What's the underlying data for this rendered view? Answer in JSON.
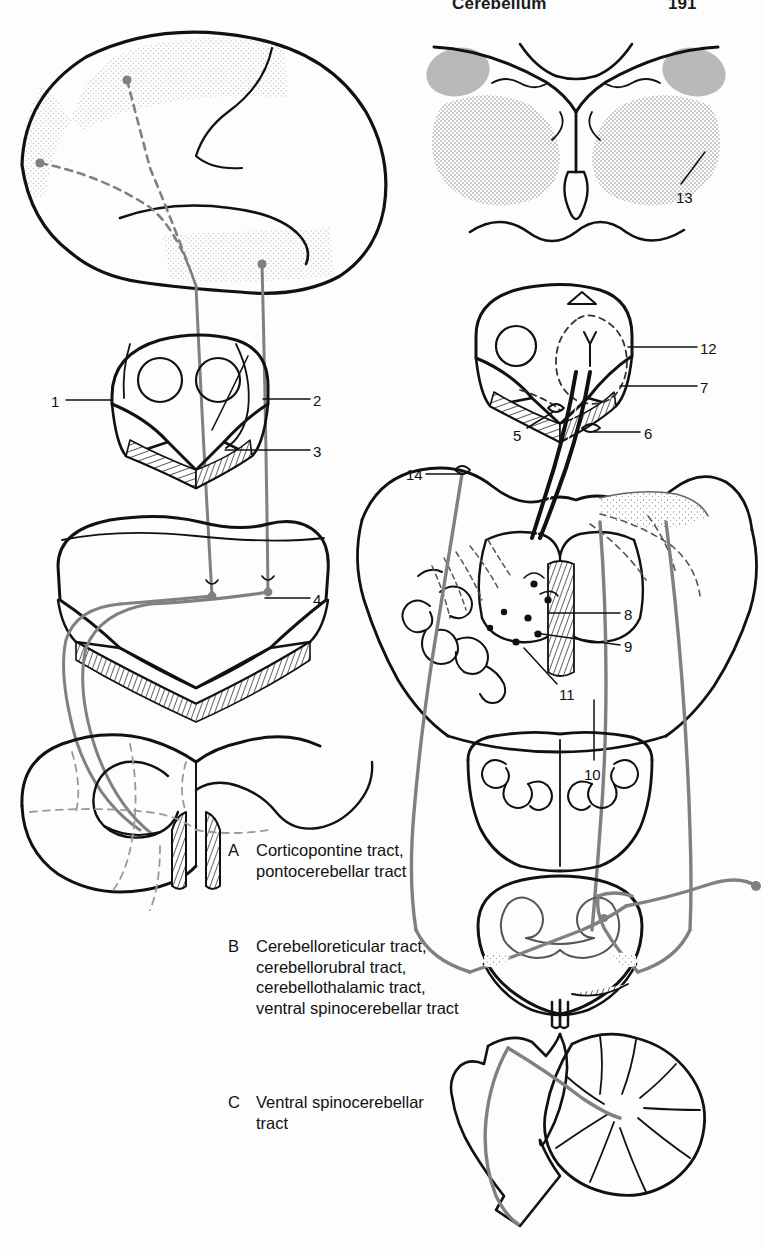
{
  "page": {
    "width": 763,
    "height": 1250,
    "background": "#fdfdfd",
    "running_head": {
      "title": "Cerebellum",
      "page_number": "191"
    }
  },
  "figure": {
    "ink_color": "#111111",
    "tract_color": "#808080",
    "shade_color": "#b8b8b8",
    "light_shade_color": "#dcdcdc",
    "panels": [
      {
        "id": "cerebral-hemisphere",
        "name": "Lateral cerebral hemisphere"
      },
      {
        "id": "diencephalon-section",
        "name": "Thalamus cross-section"
      },
      {
        "id": "midbrain-section-left",
        "name": "Midbrain cross-section"
      },
      {
        "id": "midbrain-section-right",
        "name": "Midbrain cross-section"
      },
      {
        "id": "pons-section-left",
        "name": "Pons cross-section"
      },
      {
        "id": "pons-cerebellum-section",
        "name": "Pons and cerebellum cross-section"
      },
      {
        "id": "medulla-section-left",
        "name": "Medulla oblongata cross-section"
      },
      {
        "id": "medulla-section-right",
        "name": "Medulla oblongata cross-section"
      },
      {
        "id": "spinal-cord-section",
        "name": "Spinal cord cross-section"
      },
      {
        "id": "cerebellum-sagittal",
        "name": "Cerebellum and brainstem sagittal view"
      }
    ]
  },
  "numbered_labels": [
    {
      "id": "1",
      "text": "1",
      "x": 51,
      "y": 394,
      "leader": {
        "x1": 66,
        "y1": 400,
        "x2": 112,
        "y2": 400
      }
    },
    {
      "id": "2",
      "text": "2",
      "x": 313,
      "y": 393,
      "leader": {
        "x1": 310,
        "y1": 399,
        "x2": 263,
        "y2": 399
      }
    },
    {
      "id": "3",
      "text": "3",
      "x": 313,
      "y": 444,
      "leader": {
        "x1": 310,
        "y1": 450,
        "x2": 225,
        "y2": 450
      }
    },
    {
      "id": "4",
      "text": "4",
      "x": 313,
      "y": 592,
      "leader": {
        "x1": 310,
        "y1": 598,
        "x2": 265,
        "y2": 598
      }
    },
    {
      "id": "5",
      "text": "5",
      "x": 513,
      "y": 428,
      "leader": {
        "x1": 527,
        "y1": 428,
        "x2": 553,
        "y2": 412
      }
    },
    {
      "id": "6",
      "text": "6",
      "x": 644,
      "y": 426,
      "leader": {
        "x1": 640,
        "y1": 432,
        "x2": 594,
        "y2": 432
      }
    },
    {
      "id": "7",
      "text": "7",
      "x": 700,
      "y": 380,
      "leader": {
        "x1": 697,
        "y1": 386,
        "x2": 620,
        "y2": 386
      }
    },
    {
      "id": "8",
      "text": "8",
      "x": 624,
      "y": 607,
      "leader": {
        "x1": 620,
        "y1": 613,
        "x2": 548,
        "y2": 613
      }
    },
    {
      "id": "9",
      "text": "9",
      "x": 624,
      "y": 639,
      "leader": {
        "x1": 620,
        "y1": 645,
        "x2": 535,
        "y2": 633
      }
    },
    {
      "id": "10",
      "text": "10",
      "x": 584,
      "y": 767,
      "leader": {
        "x1": 594,
        "y1": 760,
        "x2": 594,
        "y2": 700
      }
    },
    {
      "id": "11",
      "text": "11",
      "x": 559,
      "y": 687,
      "leader": {
        "x1": 557,
        "y1": 684,
        "x2": 524,
        "y2": 648
      }
    },
    {
      "id": "12",
      "text": "12",
      "x": 700,
      "y": 341,
      "leader": {
        "x1": 697,
        "y1": 347,
        "x2": 628,
        "y2": 347
      }
    },
    {
      "id": "13",
      "text": "13",
      "x": 676,
      "y": 190,
      "leader": {
        "x1": 681,
        "y1": 184,
        "x2": 705,
        "y2": 152
      }
    },
    {
      "id": "14",
      "text": "14",
      "x": 406,
      "y": 467,
      "leader": {
        "x1": 426,
        "y1": 474,
        "x2": 462,
        "y2": 474
      }
    }
  ],
  "captions": [
    {
      "id": "A",
      "letter": "A",
      "text": "Corticopontine tract,\npontocerebellar tract",
      "x": 228,
      "y": 840
    },
    {
      "id": "B",
      "letter": "B",
      "text": "Cerebelloreticular tract,\ncerebellorubral tract,\ncerebellothalamic tract,\nventral spinocerebellar tract",
      "x": 228,
      "y": 936
    },
    {
      "id": "C",
      "letter": "C",
      "text": "Ventral spinocerebellar\ntract",
      "x": 228,
      "y": 1092
    }
  ]
}
